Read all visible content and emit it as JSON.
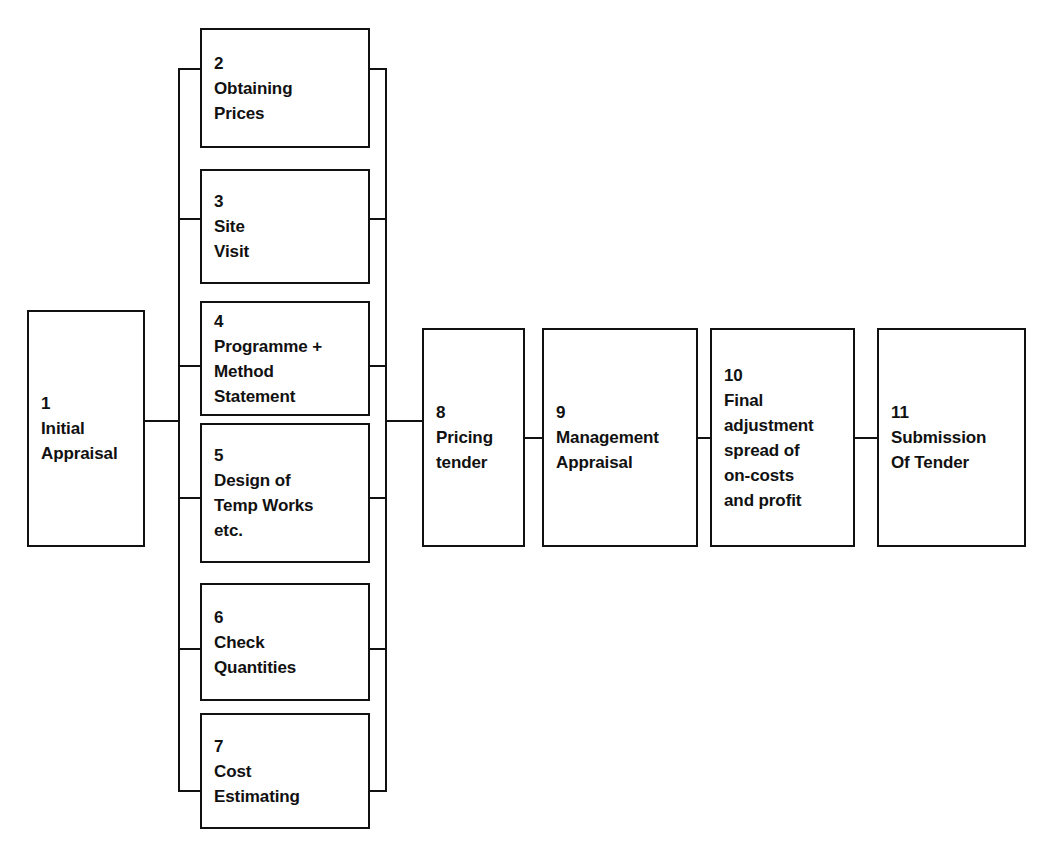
{
  "diagram": {
    "type": "flowchart",
    "line_color": "#111111",
    "background_color": "#ffffff",
    "nodes": [
      {
        "id": "1",
        "number": "1",
        "lines": [
          "1",
          "Initial",
          "Appraisal"
        ],
        "label": "Initial Appraisal",
        "x": 27,
        "y": 310,
        "w": 118,
        "h": 237
      },
      {
        "id": "2",
        "number": "2",
        "lines": [
          "2",
          "Obtaining",
          "Prices"
        ],
        "label": "Obtaining Prices",
        "x": 200,
        "y": 28,
        "w": 170,
        "h": 120
      },
      {
        "id": "3",
        "number": "3",
        "lines": [
          "3",
          "Site",
          "Visit"
        ],
        "label": "Site Visit",
        "x": 200,
        "y": 169,
        "w": 170,
        "h": 115
      },
      {
        "id": "4",
        "number": "4",
        "lines": [
          "4",
          "Programme +",
          "Method",
          "Statement"
        ],
        "label": "Programme + Method Statement",
        "x": 200,
        "y": 301,
        "w": 170,
        "h": 115
      },
      {
        "id": "5",
        "number": "5",
        "lines": [
          "5",
          "Design of",
          "Temp Works",
          "etc."
        ],
        "label": "Design of Temp Works etc.",
        "x": 200,
        "y": 423,
        "w": 170,
        "h": 140
      },
      {
        "id": "6",
        "number": "6",
        "lines": [
          "6",
          "Check",
          "Quantities"
        ],
        "label": "Check Quantities",
        "x": 200,
        "y": 583,
        "w": 170,
        "h": 118
      },
      {
        "id": "7",
        "number": "7",
        "lines": [
          "7",
          "Cost",
          "Estimating"
        ],
        "label": "Cost Estimating",
        "x": 200,
        "y": 713,
        "w": 170,
        "h": 116
      },
      {
        "id": "8",
        "number": "8",
        "lines": [
          "8",
          "Pricing",
          "tender"
        ],
        "label": "Pricing tender",
        "x": 422,
        "y": 328,
        "w": 103,
        "h": 219
      },
      {
        "id": "9",
        "number": "9",
        "lines": [
          "9",
          "Management",
          "Appraisal"
        ],
        "label": "Management Appraisal",
        "x": 542,
        "y": 328,
        "w": 156,
        "h": 219
      },
      {
        "id": "10",
        "number": "10",
        "lines": [
          "10",
          "Final",
          "adjustment",
          "spread of",
          "on-costs",
          "and profit"
        ],
        "label": "Final adjustment spread of on-costs and profit",
        "x": 710,
        "y": 328,
        "w": 145,
        "h": 219
      },
      {
        "id": "11",
        "number": "11",
        "lines": [
          "11",
          "Submission",
          "Of Tender"
        ],
        "label": "Submission Of Tender",
        "x": 877,
        "y": 328,
        "w": 149,
        "h": 219
      }
    ],
    "connectors": [
      {
        "name": "link-1-to-left-bus",
        "orient": "h",
        "x": 145,
        "y": 420,
        "len": 35
      },
      {
        "name": "left-bus-vertical",
        "orient": "v",
        "x": 178,
        "y": 68,
        "len": 724
      },
      {
        "name": "left-stub-node-2",
        "orient": "h",
        "x": 178,
        "y": 68,
        "len": 24
      },
      {
        "name": "left-stub-node-3",
        "orient": "h",
        "x": 178,
        "y": 218,
        "len": 24
      },
      {
        "name": "left-stub-node-4",
        "orient": "h",
        "x": 178,
        "y": 365,
        "len": 24
      },
      {
        "name": "left-stub-node-5",
        "orient": "h",
        "x": 178,
        "y": 497,
        "len": 24
      },
      {
        "name": "left-stub-node-6",
        "orient": "h",
        "x": 178,
        "y": 648,
        "len": 24
      },
      {
        "name": "left-stub-node-7",
        "orient": "h",
        "x": 178,
        "y": 790,
        "len": 24
      },
      {
        "name": "right-bus-vertical",
        "orient": "v",
        "x": 385,
        "y": 68,
        "len": 724
      },
      {
        "name": "right-stub-node-2",
        "orient": "h",
        "x": 368,
        "y": 68,
        "len": 19
      },
      {
        "name": "right-stub-node-3",
        "orient": "h",
        "x": 368,
        "y": 218,
        "len": 19
      },
      {
        "name": "right-stub-node-4",
        "orient": "h",
        "x": 368,
        "y": 365,
        "len": 19
      },
      {
        "name": "right-stub-node-5",
        "orient": "h",
        "x": 368,
        "y": 497,
        "len": 19
      },
      {
        "name": "right-stub-node-6",
        "orient": "h",
        "x": 368,
        "y": 648,
        "len": 19
      },
      {
        "name": "right-stub-node-7",
        "orient": "h",
        "x": 368,
        "y": 790,
        "len": 19
      },
      {
        "name": "link-right-bus-to-8",
        "orient": "h",
        "x": 385,
        "y": 420,
        "len": 39
      },
      {
        "name": "link-8-to-9",
        "orient": "h",
        "x": 524,
        "y": 437,
        "len": 19
      },
      {
        "name": "link-9-to-10",
        "orient": "h",
        "x": 697,
        "y": 437,
        "len": 14
      },
      {
        "name": "link-10-to-11",
        "orient": "h",
        "x": 854,
        "y": 437,
        "len": 24
      }
    ]
  }
}
